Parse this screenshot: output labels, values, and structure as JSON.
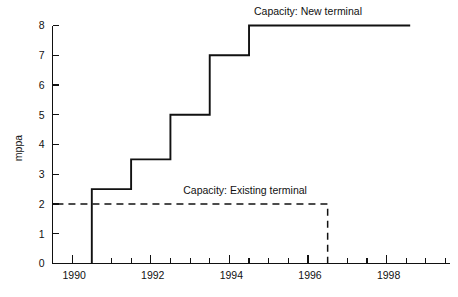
{
  "chart_data": {
    "type": "line",
    "title": "",
    "xlabel": "",
    "ylabel": "mppa",
    "xlim": [
      1989.5,
      1999.6
    ],
    "ylim": [
      0,
      8
    ],
    "grid": false,
    "legend_position": "inline-annotations",
    "x_tick_labels": [
      "1990",
      "1992",
      "1994",
      "1996",
      "1998"
    ],
    "x_tick_values": [
      1990,
      1992,
      1994,
      1996,
      1998
    ],
    "x_minor_tick_interval": 0.5,
    "y_tick_labels": [
      "0",
      "1",
      "2",
      "3",
      "4",
      "5",
      "6",
      "7",
      "8"
    ],
    "y_tick_values": [
      0,
      1,
      2,
      3,
      4,
      5,
      6,
      7,
      8
    ],
    "annotations": [
      {
        "text": "Capacity: New terminal",
        "x": 1996.0,
        "y": 8.35
      },
      {
        "text": "Capacity: Existing terminal",
        "x": 1994.4,
        "y": 2.35
      }
    ],
    "series": [
      {
        "name": "Capacity: New terminal",
        "style": "solid",
        "step": "post",
        "points": [
          {
            "x": 1990.5,
            "y": 0
          },
          {
            "x": 1990.5,
            "y": 2.5
          },
          {
            "x": 1991.5,
            "y": 2.5
          },
          {
            "x": 1991.5,
            "y": 3.5
          },
          {
            "x": 1992.5,
            "y": 3.5
          },
          {
            "x": 1992.5,
            "y": 5.0
          },
          {
            "x": 1993.5,
            "y": 5.0
          },
          {
            "x": 1993.5,
            "y": 7.0
          },
          {
            "x": 1994.5,
            "y": 7.0
          },
          {
            "x": 1994.5,
            "y": 8.0
          },
          {
            "x": 1998.6,
            "y": 8.0
          }
        ]
      },
      {
        "name": "Capacity: Existing terminal",
        "style": "dashed",
        "step": "post",
        "points": [
          {
            "x": 1989.6,
            "y": 2.0
          },
          {
            "x": 1996.5,
            "y": 2.0
          },
          {
            "x": 1996.5,
            "y": 0
          }
        ]
      }
    ]
  },
  "axes": {
    "y_axis_label": "mppa",
    "y_ticks": [
      "8",
      "7",
      "6",
      "5",
      "4",
      "3",
      "2",
      "1",
      "0"
    ],
    "x_ticks": [
      "1990",
      "1992",
      "1994",
      "1996",
      "1998"
    ]
  },
  "labels": {
    "new_terminal": "Capacity: New terminal",
    "existing_terminal": "Capacity: Existing terminal"
  },
  "colors": {
    "line": "#111111",
    "axis": "#111111",
    "background": "#ffffff"
  }
}
